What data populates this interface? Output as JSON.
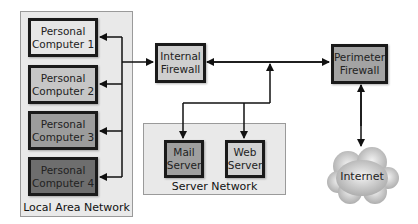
{
  "groups": {
    "lan": {
      "label": "Local Area Network"
    },
    "server_network": {
      "label": "Server Network"
    }
  },
  "nodes": {
    "pc1": {
      "label": "Personal\nComputer 1",
      "fill": "#e6e6e6"
    },
    "pc2": {
      "label": "Personal\nComputer 2",
      "fill": "#c6c6c6"
    },
    "pc3": {
      "label": "Personal\nComputer 3",
      "fill": "#9c9c9c"
    },
    "pc4": {
      "label": "Personal\nComputer 4",
      "fill": "#6e6e6e"
    },
    "internal_firewall": {
      "label": "Internal\nFirewall",
      "fill": "#cfcfcf"
    },
    "perimeter_firewall": {
      "label": "Perimeter\nFirewall",
      "fill": "#a3a3a3"
    },
    "mail_server": {
      "label": "Mail\nServer",
      "fill": "#9f9f9f"
    },
    "web_server": {
      "label": "Web\nServer",
      "fill": "#d2d2d2"
    },
    "internet": {
      "label": "Internet"
    }
  },
  "edges": [
    {
      "from": "lan_bus",
      "to": "pc1",
      "direction": "to"
    },
    {
      "from": "lan_bus",
      "to": "pc2",
      "direction": "to"
    },
    {
      "from": "lan_bus",
      "to": "pc3",
      "direction": "to"
    },
    {
      "from": "lan_bus",
      "to": "pc4",
      "direction": "to"
    },
    {
      "from": "lan_bus",
      "to": "internal_firewall",
      "direction": "to"
    },
    {
      "from": "internal_firewall",
      "to": "perimeter_firewall",
      "direction": "both"
    },
    {
      "from": "server_bus",
      "to": "internal_firewall_link",
      "direction": "to"
    },
    {
      "from": "server_bus",
      "to": "mail_server",
      "direction": "to"
    },
    {
      "from": "server_bus",
      "to": "web_server",
      "direction": "to"
    },
    {
      "from": "perimeter_firewall",
      "to": "internet",
      "direction": "both"
    }
  ]
}
